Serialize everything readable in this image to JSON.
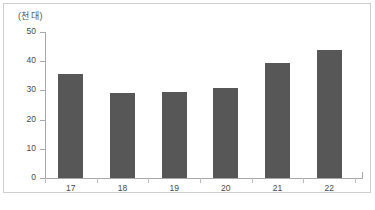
{
  "chart_data": {
    "type": "bar",
    "title": "",
    "subtitle": "",
    "xlabel": "",
    "ylabel": "(천 대)",
    "unit_label": "(천 대)",
    "categories": [
      "17",
      "18",
      "19",
      "20",
      "21",
      "22"
    ],
    "values": [
      35.5,
      29.2,
      29.5,
      30.7,
      39.5,
      43.8
    ],
    "series": [
      {
        "name": "",
        "values": [
          35.5,
          29.2,
          29.5,
          30.7,
          39.5,
          43.8
        ]
      }
    ],
    "ylim": [
      0,
      50
    ],
    "yticks": [
      0,
      10,
      20,
      30,
      40,
      50
    ],
    "ytick_labels": [
      "0",
      "10",
      "20",
      "30",
      "40",
      "50"
    ],
    "xtick_labels": [
      "17",
      "18",
      "19",
      "20",
      "21",
      "22"
    ],
    "grid": false,
    "legend": false,
    "legend_position": "none",
    "bar_color": "#575757",
    "background_color": "#ffffff",
    "axis_color": "#a8a8a8",
    "frame_color": "#cfcfcf"
  },
  "corner_note": ""
}
